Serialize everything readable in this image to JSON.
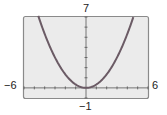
{
  "chart_data": {
    "type": "line",
    "title": "",
    "xlabel": "",
    "ylabel": "",
    "xlim": [
      -6,
      6
    ],
    "ylim": [
      -1,
      7
    ],
    "grid": false,
    "function": "y = x^2/3",
    "series": [
      {
        "name": "parabola",
        "x": [
          -4.6,
          -4,
          -3,
          -2,
          -1,
          0,
          1,
          2,
          3,
          4,
          4.6
        ],
        "y": [
          7.05,
          5.33,
          3,
          1.33,
          0.33,
          0,
          0.33,
          1.33,
          3,
          5.33,
          7.05
        ]
      }
    ],
    "tick_labels": {
      "xmin": "−6",
      "xmax": "6",
      "ymax": "7",
      "ymin": "−1"
    },
    "colors": {
      "curve": "#6b5b65",
      "screen": "#ebebeb",
      "frame": "#8a8a8a"
    }
  }
}
